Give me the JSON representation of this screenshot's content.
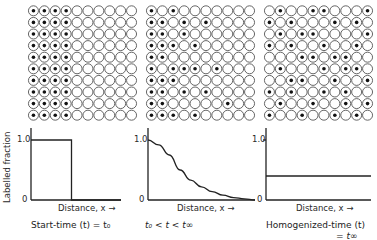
{
  "figure": {
    "ylabel": "Labelled fraction",
    "colors": {
      "line": "#222222",
      "circle_stroke": "#555555",
      "dot": "#111111",
      "background": "#ffffff"
    },
    "grids": [
      {
        "name": "start",
        "rows": 10,
        "cols": 10,
        "dots": [
          [
            0,
            1,
            2,
            3
          ],
          [
            0,
            1,
            2,
            3
          ],
          [
            0,
            1,
            2,
            3
          ],
          [
            0,
            1,
            2,
            3
          ],
          [
            0,
            1,
            2,
            3
          ],
          [
            0,
            1,
            2,
            3
          ],
          [
            0,
            1,
            2,
            3
          ],
          [
            0,
            1,
            2,
            3
          ],
          [
            0,
            1,
            2,
            3
          ],
          [
            0,
            1,
            2,
            3
          ]
        ]
      },
      {
        "name": "intermediate",
        "rows": 10,
        "cols": 10,
        "dots": [
          [
            0,
            2
          ],
          [
            0,
            1,
            3,
            5
          ],
          [
            0,
            1,
            3
          ],
          [
            0,
            1,
            2,
            4
          ],
          [
            0,
            1
          ],
          [
            0,
            2,
            3,
            4,
            6
          ],
          [
            0,
            1,
            2
          ],
          [
            0,
            1,
            3,
            5
          ],
          [
            0,
            1,
            7
          ],
          [
            0,
            1,
            2,
            4
          ]
        ]
      },
      {
        "name": "homogenized",
        "rows": 10,
        "cols": 10,
        "dots": [
          [
            1,
            4,
            5,
            9
          ],
          [
            0,
            2,
            6,
            8
          ],
          [
            1,
            3,
            4,
            9
          ],
          [
            0,
            2,
            5,
            8
          ],
          [
            3,
            4,
            6,
            7
          ],
          [
            1,
            5,
            7,
            8
          ],
          [
            2,
            3,
            6,
            9
          ],
          [
            0,
            2,
            5,
            7
          ],
          [
            1,
            4,
            7,
            9
          ],
          [
            0,
            3,
            6,
            8
          ]
        ]
      }
    ],
    "panels": [
      {
        "tick_top": "1.0",
        "tick_bottom": "0",
        "xlabel": "Distance, x →",
        "caption": "Start-time (t) = t₀"
      },
      {
        "tick_top": "1.0",
        "tick_bottom": "0",
        "xlabel": "Distance, x →",
        "caption": "t₀ < t < t∞"
      },
      {
        "tick_top": "1.0",
        "tick_bottom": "0",
        "xlabel": "Distance, x →",
        "caption": "Homogenized-time (t)",
        "caption_line2": "= t∞"
      }
    ]
  },
  "chart_data": [
    {
      "type": "line",
      "title": "Start-time (t) = t0",
      "xlabel": "Distance, x",
      "ylabel": "Labelled fraction",
      "ylim": [
        0,
        1.0
      ],
      "x": [
        0,
        0.45,
        0.45,
        1.0
      ],
      "values": [
        1.0,
        1.0,
        0,
        0
      ],
      "description": "step function: 1.0 in first ~45% of distance, 0 beyond"
    },
    {
      "type": "line",
      "title": "t0 < t < t∞",
      "xlabel": "Distance, x",
      "ylabel": "Labelled fraction",
      "ylim": [
        0,
        1.0
      ],
      "x": [
        0,
        0.1,
        0.2,
        0.3,
        0.4,
        0.5,
        0.6,
        0.7,
        0.8,
        0.9,
        1.0
      ],
      "values": [
        1.0,
        0.92,
        0.75,
        0.5,
        0.33,
        0.22,
        0.14,
        0.08,
        0.04,
        0.02,
        0.0
      ],
      "description": "sigmoidal decay from 1.0 to 0"
    },
    {
      "type": "line",
      "title": "Homogenized-time (t) = t∞",
      "xlabel": "Distance, x",
      "ylabel": "Labelled fraction",
      "ylim": [
        0,
        1.0
      ],
      "x": [
        0,
        1.0
      ],
      "values": [
        0.4,
        0.4
      ],
      "description": "constant at ~0.4"
    }
  ]
}
